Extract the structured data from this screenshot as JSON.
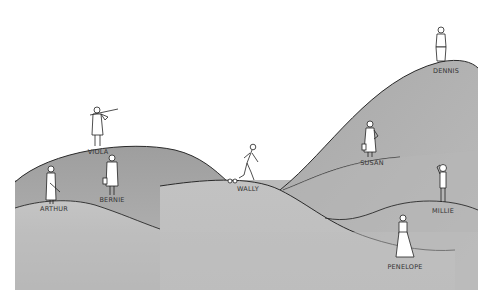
{
  "scene": {
    "description": "Cartoon illustration of people standing at various heights on rolling gray hills",
    "colors": {
      "background": "#ffffff",
      "hill_fill": "#b4b4b4",
      "hill_fill_light": "#c6c6c6",
      "hill_fill_dark": "#9a9a9a",
      "outline": "#2a2a2a"
    }
  },
  "characters": [
    {
      "name": "DENNIS",
      "pose": "standing on highest hill peak",
      "label_x": 446,
      "label_y": 72
    },
    {
      "name": "VIOLA",
      "pose": "playing violin on left hill top",
      "label_x": 98,
      "label_y": 152
    },
    {
      "name": "SUSAN",
      "pose": "standing with hand on hip, holding bag",
      "label_x": 372,
      "label_y": 162
    },
    {
      "name": "BERNIE",
      "pose": "standing holding briefcase",
      "label_x": 112,
      "label_y": 198
    },
    {
      "name": "WALLY",
      "pose": "walking / running with shackle at ankle",
      "label_x": 248,
      "label_y": 188
    },
    {
      "name": "ARTHUR",
      "pose": "standing holding flute",
      "label_x": 54,
      "label_y": 207
    },
    {
      "name": "MILLIE",
      "pose": "standing with hand on head",
      "label_x": 443,
      "label_y": 209
    },
    {
      "name": "PENELOPE",
      "pose": "standing in long white dress",
      "label_x": 405,
      "label_y": 265
    }
  ]
}
